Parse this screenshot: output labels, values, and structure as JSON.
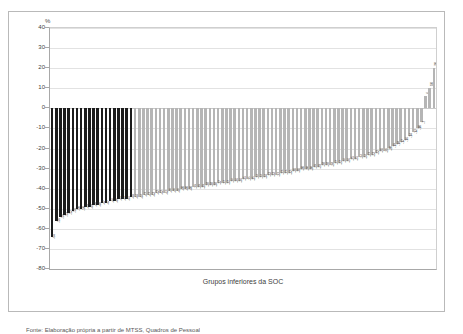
{
  "figure": {
    "unit_label": "%",
    "xlabel": "Grupos inferiores da SOC",
    "caption": "Fonte: Elaboração própria a partir de MTSS, Quadros de Pessoal"
  },
  "chart_data": {
    "type": "bar",
    "title": "",
    "subtitle": "",
    "xlabel": "Grupos inferiores da SOC",
    "ylabel": "%",
    "ylim": [
      -80,
      40
    ],
    "yticks": [
      40,
      30,
      20,
      10,
      0,
      -10,
      -20,
      -30,
      -40,
      -50,
      -60,
      -70,
      -80
    ],
    "ytick_labels": [
      "40",
      "30",
      "20",
      "10",
      "0",
      "-10",
      "-20",
      "-30",
      "-40",
      "-50",
      "-60",
      "-70",
      "-80"
    ],
    "grid": true,
    "legend": false,
    "series_colors": {
      "highlight": "#1c1c1c",
      "normal": "#b5b5b5"
    },
    "highlight_count": 20,
    "categories": [
      "1",
      "2",
      "3",
      "4",
      "5",
      "6",
      "7",
      "8",
      "9",
      "10",
      "11",
      "12",
      "13",
      "14",
      "15",
      "16",
      "17",
      "18",
      "19",
      "20",
      "21",
      "22",
      "23",
      "24",
      "25",
      "26",
      "27",
      "28",
      "29",
      "30",
      "31",
      "32",
      "33",
      "34",
      "35",
      "36",
      "37",
      "38",
      "39",
      "40",
      "41",
      "42",
      "43",
      "44",
      "45",
      "46",
      "47",
      "48",
      "49",
      "50",
      "51",
      "52",
      "53",
      "54",
      "55",
      "56",
      "57",
      "58",
      "59",
      "60",
      "61",
      "62",
      "63",
      "64",
      "65",
      "66",
      "67",
      "68",
      "69",
      "70",
      "71",
      "72",
      "73",
      "74",
      "75",
      "76",
      "77",
      "78",
      "79",
      "80",
      "81",
      "82",
      "83",
      "84",
      "85",
      "86",
      "87",
      "88",
      "89",
      "90",
      "91",
      "92",
      "93"
    ],
    "values": [
      -64,
      -56,
      -54,
      -53,
      -52,
      -51,
      -50,
      -50,
      -49,
      -49,
      -48,
      -48,
      -47,
      -47,
      -46,
      -46,
      -45,
      -45,
      -45,
      -44,
      -44,
      -44,
      -43,
      -43,
      -43,
      -42,
      -42,
      -42,
      -41,
      -41,
      -41,
      -40,
      -40,
      -40,
      -39,
      -39,
      -39,
      -38,
      -38,
      -38,
      -37,
      -37,
      -37,
      -36,
      -36,
      -36,
      -35,
      -35,
      -35,
      -34,
      -34,
      -34,
      -33,
      -33,
      -33,
      -32,
      -32,
      -32,
      -31,
      -31,
      -30,
      -30,
      -30,
      -29,
      -29,
      -28,
      -28,
      -28,
      -27,
      -27,
      -26,
      -26,
      -25,
      -25,
      -24,
      -24,
      -23,
      -23,
      -22,
      -21,
      -21,
      -20,
      -19,
      -18,
      -17,
      -16,
      -14,
      -12,
      -10,
      -7,
      6,
      10,
      20
    ],
    "value_labels": [
      "-64",
      "-56",
      "-54",
      "-53",
      "-52",
      "-51",
      "-50",
      "-50",
      "-49",
      "-49",
      "-48",
      "-48",
      "-47",
      "-47",
      "-46",
      "-46",
      "-45",
      "-45",
      "-45",
      "-44",
      "-44",
      "-44",
      "-43",
      "-43",
      "-43",
      "-42",
      "-42",
      "-42",
      "-41",
      "-41",
      "-41",
      "-40",
      "-40",
      "-40",
      "-39",
      "-39",
      "-39",
      "-38",
      "-38",
      "-38",
      "-37",
      "-37",
      "-37",
      "-36",
      "-36",
      "-36",
      "-35",
      "-35",
      "-35",
      "-34",
      "-34",
      "-34",
      "-33",
      "-33",
      "-33",
      "-32",
      "-32",
      "-32",
      "-31",
      "-31",
      "-30",
      "-30",
      "-30",
      "-29",
      "-29",
      "-28",
      "-28",
      "-28",
      "-27",
      "-27",
      "-26",
      "-26",
      "-25",
      "-25",
      "-24",
      "-24",
      "-23",
      "-23",
      "-22",
      "-21",
      "-21",
      "-20",
      "-19",
      "-18",
      "-17",
      "-16",
      "-14",
      "-12",
      "-10",
      "-7",
      "6",
      "10",
      "20"
    ]
  }
}
